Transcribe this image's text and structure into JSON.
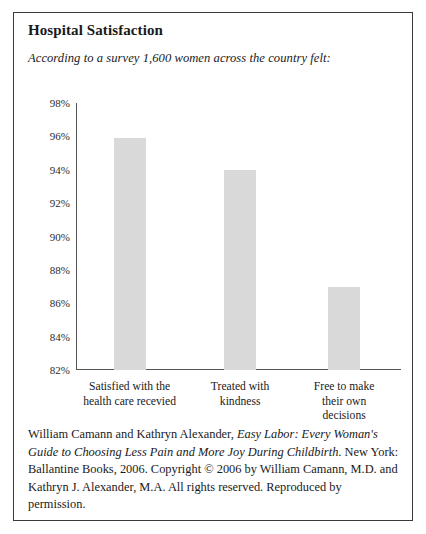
{
  "figure": {
    "title": "Hospital Satisfaction",
    "subtitle": "According to a survey 1,600 women across the country felt:",
    "caption": {
      "authors": "William Camann and Kathryn Alexander, ",
      "book_title_part1": "Easy Labor: Every Woman's Guide to Choosing Less Pain and More Joy During Childbirth",
      "rest": ". New York: Ballantine Books, 2006. Copyright © 2006 by William Camann, M.D. and Kathryn J. Alexander, M.A. All rights reserved. Reproduced by permission.",
      "full_text": "William Camann and Kathryn Alexander, Easy Labor: Every Woman's Guide to Choosing Less Pain and More Joy During Childbirth. New York: Ballantine Books, 2006. Copyright © 2006 by William Camann, M.D. and Kathryn J. Alexander, M.A. All rights reserved. Reproduced by permission."
    }
  },
  "chart_data": {
    "type": "bar",
    "title": "Hospital Satisfaction",
    "subtitle": "According to a survey 1,600 women across the country felt:",
    "categories": [
      "Satisfied with the health care recevied",
      "Treated with kindness",
      "Free to make their own decisions"
    ],
    "category_lines": [
      [
        "Satisfied with the",
        "health care recevied"
      ],
      [
        "Treated with",
        "kindness"
      ],
      [
        "Free to make",
        "their own",
        "decisions"
      ]
    ],
    "values": [
      95.9,
      94.0,
      87.0
    ],
    "value_labels": [
      "96%",
      "94%",
      "87%"
    ],
    "xlabel": "",
    "ylabel": "",
    "ylim": [
      82,
      98
    ],
    "ytick_values": [
      82,
      84,
      86,
      88,
      90,
      92,
      94,
      96,
      98
    ],
    "ytick_labels": [
      "82%",
      "84%",
      "86%",
      "88%",
      "90%",
      "92%",
      "94%",
      "96%",
      "98%"
    ],
    "grid": false,
    "legend": false,
    "bar_color": "#d9d9d9",
    "axis_color": "#555555",
    "background_color": "#ffffff"
  }
}
